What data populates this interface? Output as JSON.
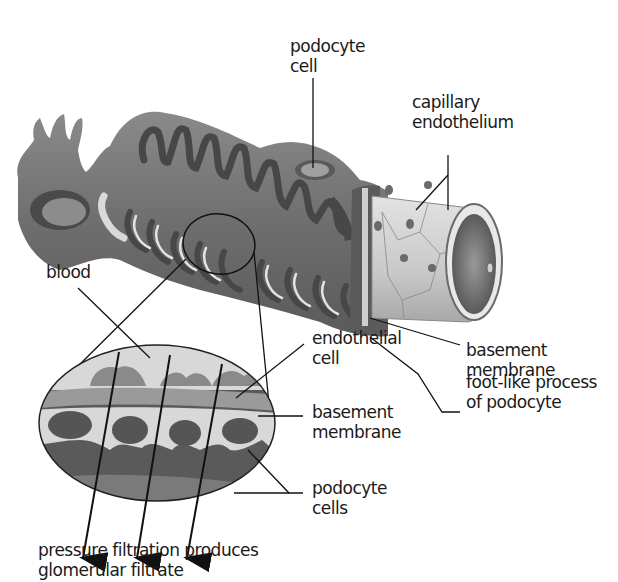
{
  "diagram": {
    "labels": {
      "podocyte_cell": "podocyte\ncell",
      "capillary_endothelium": "capillary\nendothelium",
      "blood": "blood",
      "basement_membrane_top": "basement\nmembrane",
      "endothelial_cell": "endothelial\ncell",
      "foot_like_process": "foot-like process\nof podocyte",
      "basement_membrane_inset": "basement\nmembrane",
      "podocyte_cells": "podocyte\ncells",
      "caption": "pressure filtration produces\nglomerular filtrate"
    },
    "colors": {
      "dark_tissue": "#4a4a4a",
      "mid_tissue": "#7a7a7a",
      "light_tissue": "#bdbdbd",
      "pale": "#dcdcdc",
      "line": "#1a1a1a"
    }
  }
}
